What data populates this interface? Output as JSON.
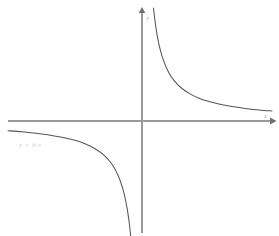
{
  "figure": {
    "kind": "math-plot",
    "width": 279,
    "height": 236,
    "background_color": "#ffffff"
  },
  "labels": {
    "y_axis_label": "y",
    "x_axis_label": "x",
    "equation_label": "y = b/x"
  },
  "colors": {
    "axis": "#9a9a9a",
    "axis_arrow": "#6f6f6f",
    "curve": "#555555",
    "axis_label_text": "#9d9d9d",
    "equation_label_text": "#d2d2d2",
    "background": "#ffffff"
  },
  "chart_data": {
    "type": "line",
    "title": "",
    "subtitle": "",
    "xlabel": "x",
    "ylabel": "y",
    "equation": "y = b/x",
    "function": "reciprocal",
    "grid": false,
    "legend": false,
    "axes_style": "arrows",
    "origin_px": [
      142,
      121
    ],
    "xlim": [
      -134,
      130
    ],
    "ylim": [
      -113,
      110
    ],
    "x_axis_pixel_y": 121,
    "y_axis_pixel_x": 142,
    "x_axis_pixel_span": [
      8,
      272
    ],
    "y_axis_pixel_span": [
      10,
      233
    ],
    "scale_constant_px2": 1300,
    "asymptotes": [
      "x = 0",
      "y = 0"
    ],
    "branches": [
      {
        "name": "quadrant-I branch",
        "quadrant": 1,
        "x": [
          11.5,
          13,
          15,
          18,
          22,
          27,
          33,
          40,
          48,
          57,
          67,
          78,
          90,
          103,
          117,
          130
        ],
        "y": [
          113.0,
          100.0,
          86.7,
          72.2,
          59.1,
          48.1,
          39.4,
          32.5,
          27.1,
          22.8,
          19.4,
          16.7,
          14.4,
          12.6,
          11.1,
          10.0
        ]
      },
      {
        "name": "quadrant-III branch",
        "quadrant": 3,
        "x": [
          -134,
          -120,
          -106,
          -93,
          -80,
          -68,
          -57,
          -47,
          -38,
          -30,
          -24,
          -19,
          -15,
          -12.5,
          -11.0,
          -10.2
        ],
        "y": [
          -9.7,
          -10.8,
          -12.3,
          -14.0,
          -16.3,
          -19.1,
          -22.8,
          -27.7,
          -34.2,
          -43.3,
          -54.2,
          -68.4,
          -86.7,
          -104.0,
          -118.2,
          -127.5
        ]
      }
    ]
  }
}
